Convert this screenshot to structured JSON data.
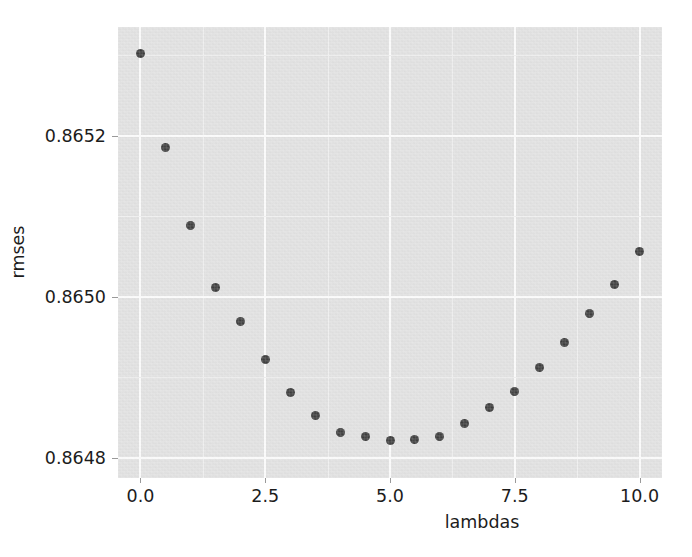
{
  "chart_data": {
    "type": "scatter",
    "title": "",
    "xlabel": "lambdas",
    "ylabel": "rmses",
    "xlim": [
      -0.45,
      10.45
    ],
    "ylim": [
      0.864775,
      0.865335
    ],
    "grid": true,
    "legend": null,
    "xticks": [
      0.0,
      2.5,
      5.0,
      7.5,
      10.0
    ],
    "xtick_labels": [
      "0.0",
      "2.5",
      "5.0",
      "7.5",
      "10.0"
    ],
    "yticks": [
      0.8648,
      0.865,
      0.8652
    ],
    "ytick_labels": [
      "0.8648",
      "0.8650",
      "0.8652"
    ],
    "x": [
      0.0,
      0.5,
      1.0,
      1.5,
      2.0,
      2.5,
      3.0,
      3.5,
      4.0,
      4.5,
      5.0,
      5.5,
      6.0,
      6.5,
      7.0,
      7.5,
      8.0,
      8.5,
      9.0,
      9.5,
      10.0
    ],
    "values": [
      0.865302,
      0.865185,
      0.865089,
      0.865012,
      0.864969,
      0.864922,
      0.864881,
      0.864853,
      0.864832,
      0.864826,
      0.864822,
      0.864823,
      0.864826,
      0.864843,
      0.864862,
      0.864883,
      0.864912,
      0.864943,
      0.864979,
      0.865015,
      0.865056
    ],
    "series_name": "rmses",
    "marker": "circle",
    "marker_color": "#3c3c3c",
    "marker_size": 9,
    "axes_facecolor": "#e2e2e2",
    "grid_color": "#fdfdfd",
    "figure_facecolor": "#ffffff"
  }
}
